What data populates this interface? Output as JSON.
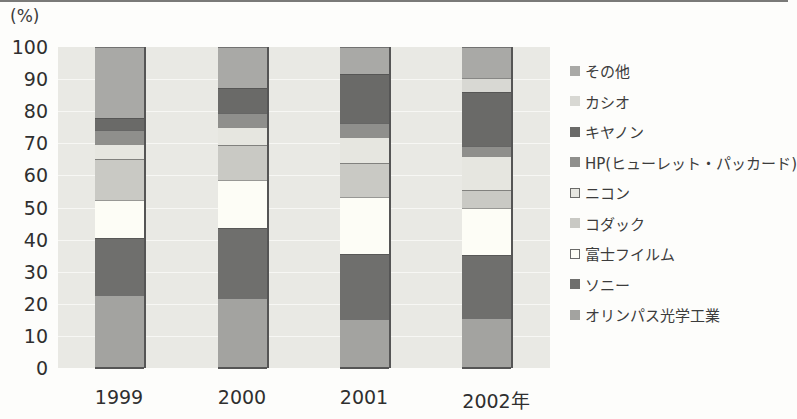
{
  "chart_data": {
    "type": "bar",
    "stacked": true,
    "title": "",
    "ylabel": "(%)",
    "xlabel": "",
    "ylim": [
      0,
      100
    ],
    "yticks": [
      "0",
      "10",
      "20",
      "30",
      "40",
      "50",
      "60",
      "70",
      "80",
      "90",
      "100"
    ],
    "categories": [
      "1999",
      "2000",
      "2001",
      "2002年"
    ],
    "grid": true,
    "legend_position": "right",
    "series": [
      {
        "name": "オリンパス光学工業",
        "color": "#a3a3a0",
        "values": [
          22.7,
          21.7,
          15.2,
          15.5
        ]
      },
      {
        "name": "ソニー",
        "color": "#6f6f6d",
        "values": [
          17.9,
          21.8,
          20.3,
          19.7
        ]
      },
      {
        "name": "富士フイルム",
        "color": "#fdfdf6",
        "values": [
          11.7,
          15.1,
          17.9,
          14.8
        ]
      },
      {
        "name": "コダック",
        "color": "#c9c9c4",
        "values": [
          12.7,
          10.9,
          10.4,
          5.6
        ]
      },
      {
        "name": "ニコン",
        "color": "#e6e6e0",
        "values": [
          4.7,
          5.5,
          8.3,
          10.5
        ]
      },
      {
        "name": "HP(ヒューレット・パッカード)",
        "color": "#8f8f8c",
        "values": [
          4.4,
          4.3,
          4.1,
          3.2
        ]
      },
      {
        "name": "キヤノン",
        "color": "#6a6a68",
        "values": [
          3.7,
          7.8,
          15.3,
          16.8
        ]
      },
      {
        "name": "カシオ",
        "color": "#d8d8d3",
        "values": [
          0,
          0,
          0,
          4.3
        ]
      },
      {
        "name": "その他",
        "color": "#a9a9a6",
        "values": [
          22.2,
          12.9,
          8.5,
          9.6
        ]
      }
    ]
  },
  "legend": [
    {
      "label": "その他",
      "color": "#a9a9a6",
      "outlined": false
    },
    {
      "label": "カシオ",
      "color": "#d8d8d3",
      "outlined": false
    },
    {
      "label": "キヤノン",
      "color": "#6a6a68",
      "outlined": false
    },
    {
      "label": "HP(ヒューレット・パッカード)",
      "color": "#8f8f8c",
      "outlined": false
    },
    {
      "label": "ニコン",
      "color": "#e6e6e0",
      "outlined": true
    },
    {
      "label": "コダック",
      "color": "#c9c9c4",
      "outlined": false
    },
    {
      "label": "富士フイルム",
      "color": "#fdfdf6",
      "outlined": true
    },
    {
      "label": "ソニー",
      "color": "#6f6f6d",
      "outlined": false
    },
    {
      "label": "オリンパス光学工業",
      "color": "#a3a3a0",
      "outlined": false
    }
  ]
}
